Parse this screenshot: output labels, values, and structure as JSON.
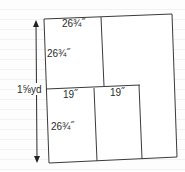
{
  "diagram": {
    "height_label": "1⅝yd",
    "pieces": [
      {
        "name": "top-left-piece",
        "width_label": "26¾˝",
        "height_label": "26¾˝"
      },
      {
        "name": "bottom-left-piece",
        "width_label": "19˝",
        "height_label": "26¾˝"
      },
      {
        "name": "bottom-middle-piece",
        "width_label": "19˝"
      }
    ],
    "colors": {
      "line": "#3a3a3a",
      "background": "#fdfdfd",
      "rule": "#f2f2f2"
    }
  }
}
